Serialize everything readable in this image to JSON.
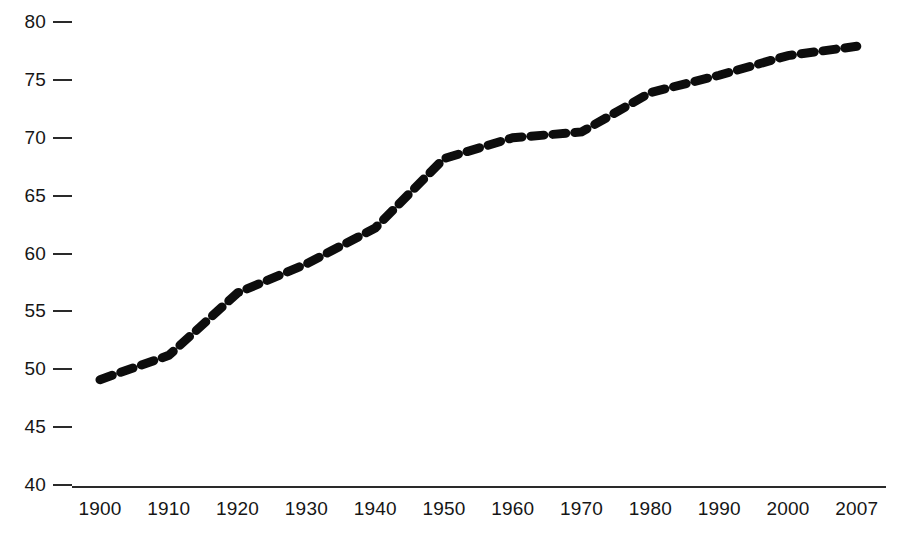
{
  "chart_data": {
    "type": "line",
    "title": "",
    "subtitle": "",
    "xlabel": "",
    "ylabel": "",
    "x": [
      1900,
      1910,
      1920,
      1930,
      1940,
      1950,
      1960,
      1970,
      1980,
      1990,
      2000,
      2007
    ],
    "categories": [
      "1900",
      "1910",
      "1920",
      "1930",
      "1940",
      "1950",
      "1960",
      "1970",
      "1980",
      "1990",
      "2000",
      "2007"
    ],
    "values": [
      49.1,
      51.2,
      56.6,
      59.1,
      62.2,
      68.2,
      70.0,
      70.5,
      73.9,
      75.4,
      77.1,
      77.9
    ],
    "series": [
      {
        "name": "Life expectancy",
        "values": [
          49.1,
          51.2,
          56.6,
          59.1,
          62.2,
          68.2,
          70.0,
          70.5,
          73.9,
          75.4,
          77.1,
          77.9
        ],
        "line_style": "dashed",
        "color": "#0d0d0d"
      }
    ],
    "ylim": [
      40,
      80
    ],
    "ytick_values": [
      40,
      45,
      50,
      55,
      60,
      65,
      70,
      75,
      80
    ],
    "ytick_labels": [
      "40",
      "45",
      "50",
      "55",
      "60",
      "65",
      "70",
      "75",
      "80"
    ],
    "xtick_labels": [
      "1900",
      "1910",
      "1920",
      "1930",
      "1940",
      "1950",
      "1960",
      "1970",
      "1980",
      "1990",
      "2000",
      "2007"
    ],
    "grid": false,
    "legend": "none",
    "axis_color": "#2a2a2a",
    "background_color": "#ffffff",
    "text_color": "#161616"
  },
  "axes": {
    "x_axis_line_label": "x-axis-baseline",
    "y_axis_tick_mark_label": "y-axis-tick-mark"
  }
}
